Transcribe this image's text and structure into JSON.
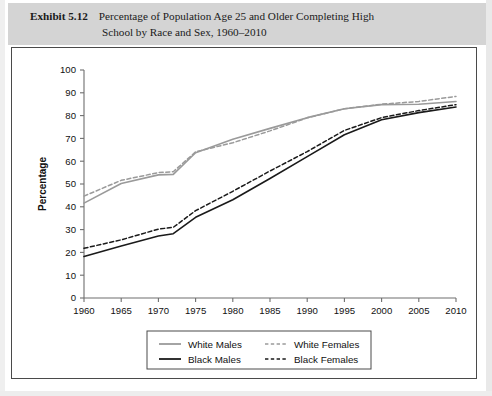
{
  "exhibit": {
    "label": "Exhibit 5.12",
    "caption_line1": "Percentage of Population Age 25 and Older Completing High",
    "caption_line2": "School by Race and Sex, 1960–2010",
    "band_color": "#d4d4d4"
  },
  "chart_data": {
    "type": "line",
    "xlabel": "",
    "ylabel": "Percentage",
    "xlim": [
      1960,
      2010
    ],
    "ylim": [
      0,
      100
    ],
    "grid": false,
    "legend_position": "bottom",
    "xticks": [
      "1960",
      "1965",
      "1970",
      "1975",
      "1980",
      "1985",
      "1990",
      "1995",
      "2000",
      "2005",
      "2010"
    ],
    "yticks": [
      "0",
      "10",
      "20",
      "30",
      "40",
      "50",
      "60",
      "70",
      "80",
      "90",
      "100"
    ],
    "x": [
      1960,
      1965,
      1970,
      1972,
      1975,
      1980,
      1985,
      1990,
      1995,
      2000,
      2005,
      2010
    ],
    "series": [
      {
        "name": "White Males",
        "color": "#9a9a9a",
        "style": "solid",
        "values": [
          41.6,
          50.2,
          54.0,
          54.2,
          63.7,
          69.6,
          74.4,
          79.1,
          83.0,
          84.8,
          85.0,
          86.2
        ]
      },
      {
        "name": "White Females",
        "color": "#9a9a9a",
        "style": "dashed",
        "values": [
          44.7,
          51.6,
          55.0,
          55.4,
          64.1,
          68.1,
          73.3,
          79.0,
          83.0,
          85.0,
          86.2,
          88.4
        ]
      },
      {
        "name": "Black Males",
        "color": "#1a1a1a",
        "style": "solid",
        "values": [
          18.2,
          22.8,
          27.2,
          28.2,
          35.4,
          43.1,
          52.4,
          62.0,
          71.6,
          78.2,
          81.3,
          83.8
        ]
      },
      {
        "name": "Black Females",
        "color": "#1a1a1a",
        "style": "dashed",
        "values": [
          21.8,
          25.5,
          30.2,
          31.0,
          38.3,
          46.8,
          55.7,
          64.2,
          73.5,
          79.1,
          82.2,
          84.8
        ]
      }
    ]
  },
  "legend": {
    "entries": [
      {
        "label": "White Males",
        "color": "#9a9a9a",
        "style": "solid"
      },
      {
        "label": "White Females",
        "color": "#9a9a9a",
        "style": "dashed"
      },
      {
        "label": "Black Males",
        "color": "#1a1a1a",
        "style": "solid"
      },
      {
        "label": "Black Females",
        "color": "#1a1a1a",
        "style": "dashed"
      }
    ]
  }
}
